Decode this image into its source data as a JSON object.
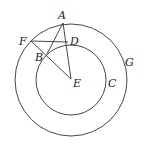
{
  "diagram": {
    "type": "geometry",
    "center": {
      "label": "E",
      "x": 71,
      "y": 79
    },
    "circles": [
      {
        "name": "outer",
        "label": "G",
        "cx": 71,
        "cy": 80,
        "r": 56
      },
      {
        "name": "inner",
        "label": "C",
        "cx": 71,
        "cy": 80,
        "r": 35
      }
    ],
    "points": [
      {
        "label": "A",
        "x": 63,
        "y": 23,
        "lx": 58,
        "ly": 19
      },
      {
        "label": "F",
        "x": 31,
        "y": 41,
        "lx": 19,
        "ly": 45
      },
      {
        "label": "D",
        "x": 68,
        "y": 42,
        "lx": 70,
        "ly": 42
      },
      {
        "label": "B",
        "x": 47,
        "y": 54,
        "lx": 35,
        "ly": 61
      },
      {
        "label": "E",
        "x": 71,
        "y": 79,
        "lx": 73,
        "ly": 87
      },
      {
        "label": "C",
        "x": 106,
        "y": 80,
        "lx": 108,
        "ly": 86
      },
      {
        "label": "G",
        "x": 126,
        "y": 60,
        "lx": 125,
        "ly": 66
      }
    ],
    "segments": [
      [
        "A",
        "B"
      ],
      [
        "A",
        "E"
      ],
      [
        "F",
        "D"
      ],
      [
        "F",
        "E"
      ]
    ]
  }
}
